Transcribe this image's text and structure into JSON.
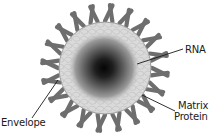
{
  "diagram": {
    "type": "virus-structure",
    "labels": {
      "rna": "RNA",
      "matrix_line1": "Matrix",
      "matrix_line2": "Protein",
      "envelope": "Envelope"
    },
    "colors": {
      "spike": "#6e6e6e",
      "shell": "#d9d9d9",
      "shell_texture": "#b8b8b8",
      "core_center": "#050505",
      "core_mid": "#5a5a5a",
      "core_edge": "#c8c8c8",
      "leader_line": "#1a1a1a",
      "background": "#ffffff"
    },
    "geometry": {
      "center_x": 105,
      "center_y": 68,
      "shell_radius": 46,
      "spike_inner_radius": 47,
      "spike_outer_radius": 63,
      "spike_count": 40
    }
  }
}
